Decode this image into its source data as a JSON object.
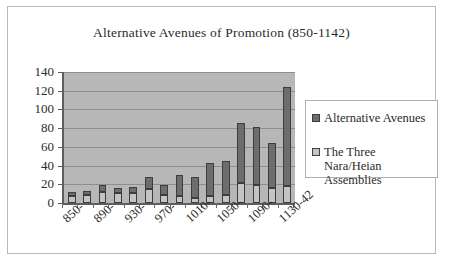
{
  "chart_data": {
    "type": "bar",
    "subtype": "stacked-vertical",
    "title": "Alternative Avenues of Promotion (850-1142)",
    "xlabel": "",
    "ylabel": "",
    "ylim": [
      0,
      140
    ],
    "ytick_step": 20,
    "yticks": [
      0,
      20,
      40,
      60,
      80,
      100,
      120,
      140
    ],
    "ytick_labels": [
      "0",
      "20",
      "40",
      "60",
      "80",
      "100",
      "120",
      "140"
    ],
    "grid": "horizontal",
    "legend_position": "right",
    "plot_background": "#b7b7b7",
    "categories": [
      "850-",
      "870-",
      "890-",
      "910-",
      "930-",
      "950-",
      "970-",
      "990-",
      "1010-",
      "1030-",
      "1050-",
      "1070-",
      "1090-",
      "1110-",
      "1130-42"
    ],
    "xtick_labels": [
      "850-",
      "890-",
      "930-",
      "970-",
      "1010-",
      "1050-",
      "1090-",
      "1130-42"
    ],
    "xtick_label_indices": [
      0,
      2,
      4,
      6,
      8,
      10,
      12,
      14
    ],
    "series": [
      {
        "name": "The Three Nara/Heian Assemblies",
        "color": "#c4c4c4",
        "values": [
          8,
          9,
          12,
          11,
          11,
          15,
          9,
          8,
          5,
          8,
          9,
          21,
          19,
          16,
          18
        ]
      },
      {
        "name": "Alternative Avenues",
        "color": "#6d6d6d",
        "values": [
          4,
          4,
          7,
          5,
          6,
          13,
          10,
          22,
          23,
          35,
          36,
          64,
          62,
          48,
          106
        ]
      }
    ],
    "totals": [
      12,
      13,
      19,
      16,
      17,
      28,
      19,
      30,
      28,
      43,
      45,
      85,
      81,
      64,
      124
    ]
  },
  "legend": {
    "items": [
      {
        "label": "Alternative Avenues",
        "color": "#6d6d6d"
      },
      {
        "label": "The Three Nara/Heian Assemblies",
        "color": "#c4c4c4"
      }
    ]
  }
}
